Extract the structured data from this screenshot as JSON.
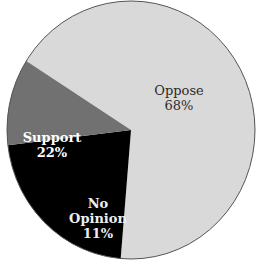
{
  "chart_data": {
    "type": "pie",
    "title": "",
    "start_angle_deg": 212.4,
    "direction": "clockwise",
    "slices": [
      {
        "label": "Oppose",
        "value": 68,
        "display": "68%",
        "color": "#d9d9d9"
      },
      {
        "label": "Support",
        "value": 22,
        "display": "22%",
        "color": "#000000"
      },
      {
        "label": "No Opinion",
        "value": 11,
        "display": "11%",
        "color": "#717171"
      }
    ],
    "legend": "none (labels placed inside slices)"
  },
  "labels": {
    "oppose": {
      "name": "Oppose",
      "pct": "68%"
    },
    "support": {
      "name": "Support",
      "pct": "22%"
    },
    "noopinion": {
      "name_line1": "No",
      "name_line2": "Opinion",
      "pct": "11%"
    }
  },
  "geometry": {
    "cx": 131,
    "cy": 130,
    "rx": 124,
    "ry": 129,
    "outline": "#555555"
  }
}
